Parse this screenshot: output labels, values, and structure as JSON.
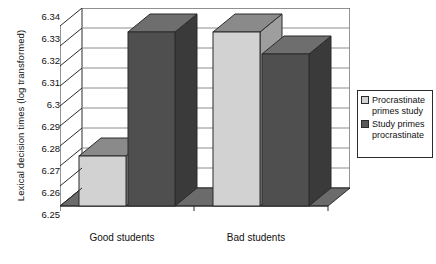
{
  "chart_data": {
    "type": "bar",
    "title": "",
    "subtitle": "",
    "xlabel": "",
    "ylabel": "Lexical decision times (log transformed)",
    "categories": [
      "Good students",
      "Bad students"
    ],
    "series": [
      {
        "name": "Procrastinate primes study",
        "values": [
          6.275,
          6.337
        ],
        "color": "#d2d2d2"
      },
      {
        "name": "Study primes procrastinate",
        "values": [
          6.337,
          6.326
        ],
        "color": "#5a5a5a"
      }
    ],
    "ylim": [
      6.25,
      6.34
    ],
    "ytick_step": 0.01,
    "ytick_labels": [
      "6.34",
      "6.33",
      "6.32",
      "6.31",
      "6.3",
      "6.29",
      "6.28",
      "6.27",
      "6.26",
      "6.25"
    ],
    "ytick_values": [
      6.34,
      6.33,
      6.32,
      6.31,
      6.3,
      6.29,
      6.28,
      6.27,
      6.26,
      6.25
    ],
    "grid": true,
    "grid_axis": "y",
    "legend_position": "right",
    "style": "3d-clustered-column",
    "plot_background": "#ffffff"
  },
  "colors": {
    "series_light": "#d2d2d2",
    "series_light_top": "#8a8a8a",
    "series_light_side": "#9e9e9e",
    "series_dark": "#4f4f4f",
    "series_dark_top": "#6e6e6e",
    "series_dark_side": "#3a3a3a",
    "axis_line": "#2b2b2b",
    "grid_line": "#8c8c8c",
    "floor": "#6b6b6b",
    "text": "#111111",
    "background": "#ffffff"
  },
  "legend": {
    "items": [
      {
        "label_line1": "Procrastinate",
        "label_line2": "primes study",
        "swatch": "#d2d2d2"
      },
      {
        "label_line1": "Study primes",
        "label_line2": "procrastinate",
        "swatch": "#5a5a5a"
      }
    ]
  }
}
